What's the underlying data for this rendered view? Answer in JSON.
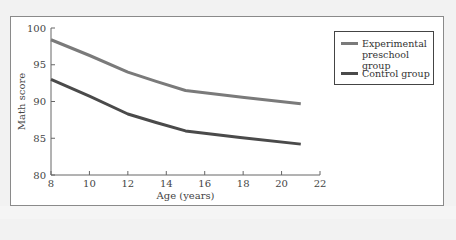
{
  "chart_data": {
    "type": "line",
    "title": "",
    "xlabel": "Age (years)",
    "ylabel": "Math score",
    "xlim": [
      8,
      22
    ],
    "ylim": [
      80,
      100
    ],
    "xticks": [
      8,
      10,
      12,
      14,
      16,
      18,
      20,
      22
    ],
    "yticks": [
      80,
      85,
      90,
      95,
      100
    ],
    "grid": false,
    "legend_position": "right",
    "series": [
      {
        "name": "Experimental preschool group",
        "color": "#7a7a7a",
        "x": [
          8,
          12,
          15,
          21
        ],
        "values": [
          98.4,
          94.0,
          91.5,
          89.7
        ]
      },
      {
        "name": "Control group",
        "color": "#4a4a4a",
        "x": [
          8,
          12,
          15,
          21
        ],
        "values": [
          93.0,
          88.3,
          86.0,
          84.2
        ]
      }
    ]
  },
  "legend": {
    "items": [
      {
        "label_line1": "Experimental",
        "label_line2": "preschool group",
        "color": "#7a7a7a"
      },
      {
        "label_line1": "Control group",
        "label_line2": "",
        "color": "#4a4a4a"
      }
    ]
  },
  "axes": {
    "x_label": "Age (years)",
    "y_label": "Math score"
  }
}
